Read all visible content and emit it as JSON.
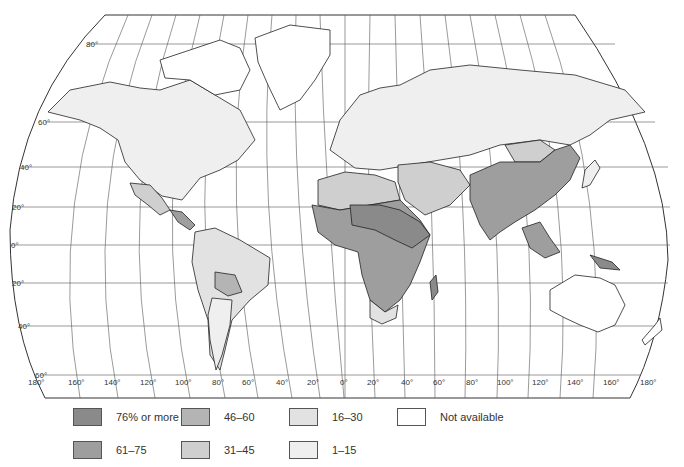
{
  "map": {
    "title": "",
    "projection": "Robinson-like world map",
    "latitude_labels": [
      "80°",
      "60°",
      "40°",
      "20°",
      "0°",
      "20°",
      "40°",
      "60°"
    ],
    "longitude_labels": [
      "180°",
      "160°",
      "140°",
      "120°",
      "100°",
      "80°",
      "60°",
      "40°",
      "20°",
      "0°",
      "20°",
      "40°",
      "60°",
      "80°",
      "100°",
      "120°",
      "140°",
      "160°",
      "180°"
    ]
  },
  "legend": {
    "items": [
      {
        "label": "76% or more",
        "color": "#8a8a8a",
        "class": "c76"
      },
      {
        "label": "61–75",
        "color": "#9e9e9e",
        "class": "c61"
      },
      {
        "label": "46–60",
        "color": "#b4b4b4",
        "class": "c46"
      },
      {
        "label": "31–45",
        "color": "#cfcfcf",
        "class": "c31"
      },
      {
        "label": "16–30",
        "color": "#e2e2e2",
        "class": "c16"
      },
      {
        "label": "1–15",
        "color": "#efefef",
        "class": "c1"
      },
      {
        "label": "Not available",
        "color": "#ffffff",
        "class": "na"
      }
    ]
  },
  "regions": [
    {
      "name": "North America (USA/Canada)",
      "category": "1–15"
    },
    {
      "name": "Greenland / Arctic islands",
      "category": "Not available"
    },
    {
      "name": "Mexico",
      "category": "31–45"
    },
    {
      "name": "Central America",
      "category": "61–75"
    },
    {
      "name": "South America (most)",
      "category": "16–30"
    },
    {
      "name": "Bolivia / Paraguay",
      "category": "46–60"
    },
    {
      "name": "Argentina",
      "category": "1–15"
    },
    {
      "name": "Europe / USSR",
      "category": "1–15"
    },
    {
      "name": "North Africa",
      "category": "31–45"
    },
    {
      "name": "Sub-Saharan Africa",
      "category": "61–75"
    },
    {
      "name": "Sahel / East Africa",
      "category": "76% or more"
    },
    {
      "name": "South Africa",
      "category": "16–30"
    },
    {
      "name": "Middle East",
      "category": "31–45"
    },
    {
      "name": "South Asia / China",
      "category": "61–75"
    },
    {
      "name": "Mongolia",
      "category": "31–45"
    },
    {
      "name": "Japan",
      "category": "1–15"
    },
    {
      "name": "Southeast Asia",
      "category": "61–75"
    },
    {
      "name": "Papua New Guinea",
      "category": "76% or more"
    },
    {
      "name": "Australia / New Zealand",
      "category": "Not available"
    }
  ]
}
